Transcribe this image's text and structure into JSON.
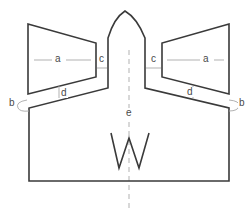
{
  "diagram": {
    "type": "sewing-pattern-schematic",
    "colors": {
      "outline": "#3a3a3a",
      "dimension": "#a8a8a8",
      "background": "#ffffff"
    },
    "labels": {
      "a_left": "a",
      "a_right": "a",
      "b_left": "b",
      "b_right": "b",
      "c_left": "c",
      "c_right": "c",
      "d_left": "d",
      "d_right": "d",
      "e": "e"
    },
    "pieces": [
      {
        "name": "left-flap",
        "shape": "trapezoid"
      },
      {
        "name": "right-flap",
        "shape": "trapezoid"
      },
      {
        "name": "main-body",
        "shape": "outline-with-pointed-top"
      },
      {
        "name": "center-pleat",
        "shape": "W"
      }
    ],
    "dimensions": [
      {
        "label": "a",
        "meaning": "flap width",
        "count": 2
      },
      {
        "label": "b",
        "meaning": "corner fold",
        "count": 2
      },
      {
        "label": "c",
        "meaning": "gap between flap and neck",
        "count": 2
      },
      {
        "label": "d",
        "meaning": "gap between flap and shoulder",
        "count": 2
      },
      {
        "label": "e",
        "meaning": "center line",
        "count": 1
      }
    ]
  }
}
